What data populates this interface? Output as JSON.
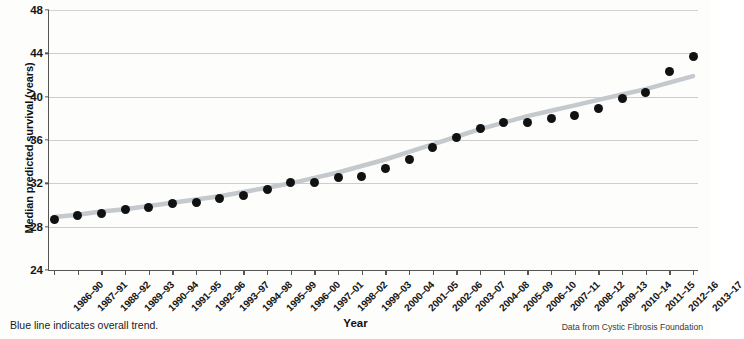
{
  "chart_data": {
    "type": "scatter",
    "title": "",
    "xlabel": "Year",
    "ylabel": "Median predicted survival (years)",
    "ylim": [
      24,
      48
    ],
    "yticks": [
      24,
      28,
      32,
      36,
      40,
      44,
      48
    ],
    "grid": true,
    "legend": "none",
    "categories": [
      "1986–90",
      "1987–91",
      "1988–92",
      "1989–93",
      "1990–94",
      "1991–95",
      "1992–96",
      "1993–97",
      "1994–98",
      "1995–99",
      "1996–00",
      "1997–01",
      "1998–02",
      "1999–03",
      "2000–04",
      "2001–05",
      "2002–06",
      "2003–07",
      "2004–08",
      "2005–09",
      "2006–10",
      "2007–11",
      "2008–12",
      "2009–13",
      "2010–14",
      "2011–15",
      "2012–16",
      "2013–17"
    ],
    "series": [
      {
        "name": "Median predicted survival",
        "type": "scatter",
        "marker": "filled-circle",
        "color": "#111111",
        "values": [
          28.7,
          29.0,
          29.2,
          29.6,
          29.8,
          30.1,
          30.2,
          30.6,
          30.9,
          31.4,
          32.1,
          32.1,
          32.5,
          32.6,
          33.4,
          34.2,
          35.3,
          36.2,
          37.1,
          37.6,
          37.6,
          38.0,
          38.3,
          38.9,
          39.8,
          40.4,
          42.3,
          43.7
        ]
      },
      {
        "name": "Overall trend",
        "type": "line",
        "color": "#c4c9cd",
        "values": [
          28.9,
          29.1,
          29.4,
          29.6,
          29.9,
          30.2,
          30.5,
          30.8,
          31.2,
          31.6,
          32.0,
          32.5,
          33.0,
          33.6,
          34.2,
          34.9,
          35.6,
          36.3,
          37.0,
          37.6,
          38.2,
          38.7,
          39.2,
          39.7,
          40.2,
          40.7,
          41.3,
          41.9
        ]
      }
    ],
    "annotations": {
      "note_left": "Blue line indicates overall trend.",
      "note_right": "Data from Cystic Fibrosis Foundation"
    }
  }
}
